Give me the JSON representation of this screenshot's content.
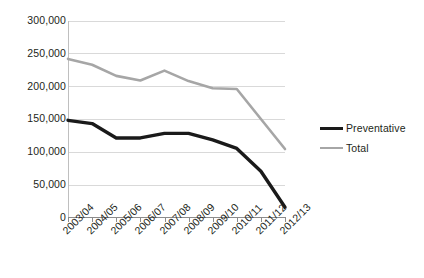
{
  "chart_data": {
    "type": "line",
    "title": "",
    "xlabel": "",
    "ylabel": "",
    "categories": [
      "2003/04",
      "2004/05",
      "2005/06",
      "2006/07",
      "2007/08",
      "2008/09",
      "2009/10",
      "2010/11",
      "2011/12",
      "2012/13"
    ],
    "series": [
      {
        "name": "Preventative",
        "color": "#1a1a1a",
        "values": [
          148000,
          143000,
          121000,
          121000,
          128000,
          128000,
          118000,
          105000,
          70000,
          15000
        ]
      },
      {
        "name": "Total",
        "color": "#a6a6a6",
        "values": [
          242000,
          233000,
          216000,
          209000,
          224000,
          208000,
          197000,
          196000,
          150000,
          104000
        ]
      }
    ],
    "ylim": [
      0,
      300000
    ],
    "yticks": [
      "0",
      "50,000",
      "100,000",
      "150,000",
      "200,000",
      "250,000",
      "300,000"
    ],
    "ytick_values": [
      0,
      50000,
      100000,
      150000,
      200000,
      250000,
      300000
    ],
    "grid": true,
    "legend_position": "right"
  },
  "legend": {
    "items": [
      {
        "label": "Preventative"
      },
      {
        "label": "Total"
      }
    ]
  }
}
